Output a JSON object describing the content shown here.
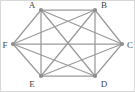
{
  "figure": {
    "width": 135,
    "height": 92,
    "background_color": "#ffffff",
    "edge_color": "#9a9a9a",
    "vertex_color": "#8e8e8e",
    "label_color": "#444444",
    "border_color": "#d8d8d8"
  },
  "chart_data": {
    "type": "diagram",
    "graph_type": "complete-graph",
    "name": "K6",
    "xlabel": "",
    "ylabel": "",
    "node_count": 6,
    "edge_count": 15,
    "nodes": [
      {
        "id": "A",
        "label": "A",
        "x": 41,
        "y": 10,
        "label_x": 32,
        "label_y": 6
      },
      {
        "id": "B",
        "label": "B",
        "x": 95,
        "y": 10,
        "label_x": 104,
        "label_y": 6
      },
      {
        "id": "C",
        "label": "C",
        "x": 122,
        "y": 44,
        "label_x": 130,
        "label_y": 46
      },
      {
        "id": "D",
        "label": "D",
        "x": 95,
        "y": 76,
        "label_x": 104,
        "label_y": 85
      },
      {
        "id": "E",
        "label": "E",
        "x": 41,
        "y": 76,
        "label_x": 32,
        "label_y": 85
      },
      {
        "id": "F",
        "label": "F",
        "x": 13,
        "y": 44,
        "label_x": 5,
        "label_y": 46
      }
    ],
    "edges": [
      {
        "source": "A",
        "target": "B"
      },
      {
        "source": "A",
        "target": "C"
      },
      {
        "source": "A",
        "target": "D"
      },
      {
        "source": "A",
        "target": "E"
      },
      {
        "source": "A",
        "target": "F"
      },
      {
        "source": "B",
        "target": "C"
      },
      {
        "source": "B",
        "target": "D"
      },
      {
        "source": "B",
        "target": "E"
      },
      {
        "source": "B",
        "target": "F"
      },
      {
        "source": "C",
        "target": "D"
      },
      {
        "source": "C",
        "target": "E"
      },
      {
        "source": "C",
        "target": "F"
      },
      {
        "source": "D",
        "target": "E"
      },
      {
        "source": "D",
        "target": "F"
      },
      {
        "source": "E",
        "target": "F"
      }
    ]
  }
}
